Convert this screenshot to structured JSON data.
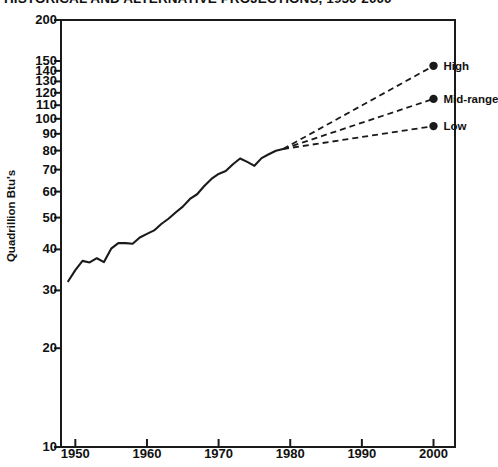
{
  "chart_data": {
    "type": "line",
    "title": "HISTORICAL AND ALTERNATIVE PROJECTIONS, 1950-2000",
    "xlabel": "",
    "ylabel": "Quadrillion Btu's",
    "xlim": [
      1948,
      2003
    ],
    "ylim": [
      10,
      200
    ],
    "yscale": "log",
    "grid": false,
    "legend_position": "right-inline-labels",
    "xticks": [
      1950,
      1960,
      1970,
      1980,
      1990,
      2000
    ],
    "xtick_labels": [
      "1950",
      "1960",
      "1970",
      "1980",
      "1990",
      "2000"
    ],
    "yticks": [
      10,
      20,
      30,
      40,
      50,
      60,
      70,
      80,
      90,
      100,
      110,
      120,
      130,
      140,
      150,
      200
    ],
    "ytick_labels": [
      "10",
      "20",
      "30",
      "40",
      "50",
      "60",
      "70",
      "80",
      "90",
      "100",
      "110",
      "120",
      "130",
      "140",
      "150",
      "200"
    ],
    "series": [
      {
        "name": "Historical",
        "style": "solid",
        "x": [
          1949,
          1950,
          1951,
          1952,
          1953,
          1954,
          1955,
          1956,
          1957,
          1958,
          1959,
          1960,
          1961,
          1962,
          1963,
          1964,
          1965,
          1966,
          1967,
          1968,
          1969,
          1970,
          1971,
          1972,
          1973,
          1974,
          1975,
          1976,
          1977,
          1978,
          1979
        ],
        "y": [
          32.0,
          34.6,
          36.9,
          36.5,
          37.6,
          36.6,
          40.2,
          41.8,
          41.8,
          41.6,
          43.5,
          44.6,
          45.7,
          47.8,
          49.6,
          51.8,
          54.0,
          57.0,
          58.9,
          62.4,
          65.6,
          67.9,
          69.3,
          72.7,
          75.7,
          73.9,
          71.9,
          75.9,
          78.0,
          79.9,
          80.9
        ]
      },
      {
        "name": "High",
        "style": "dashed",
        "x": [
          1979,
          2000
        ],
        "y": [
          80.9,
          145.0
        ]
      },
      {
        "name": "Mid-range",
        "style": "dashed",
        "x": [
          1979,
          2000
        ],
        "y": [
          80.9,
          115.0
        ]
      },
      {
        "name": "Low",
        "style": "dashed",
        "x": [
          1979,
          2000
        ],
        "y": [
          80.9,
          95.0
        ]
      }
    ],
    "annotations": [
      {
        "text": "High",
        "x": 2000,
        "y": 145.0
      },
      {
        "text": "Mid-range",
        "x": 2000,
        "y": 115.0
      },
      {
        "text": "Low",
        "x": 2000,
        "y": 95.0
      }
    ],
    "colors": {
      "line": "#1a1a1a",
      "axis": "#1a1a1a",
      "background": "#ffffff"
    }
  }
}
